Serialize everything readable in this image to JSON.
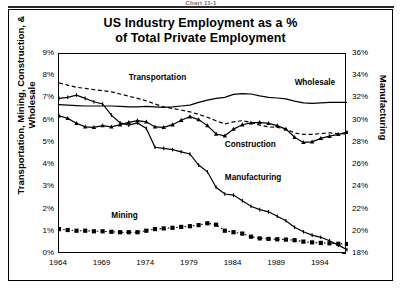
{
  "caption": "Chart 11-1",
  "chart_data": {
    "type": "line",
    "title": "US Industry Employment as a %\nof Total Private Employment",
    "title_line1": "US Industry Employment as a %",
    "title_line2": "of Total Private Employment",
    "xlabel": "",
    "ylabel": "Transportation, Mining, Construction, & Wholesale",
    "ylabel_right": "Manufacturing",
    "xlim": [
      1964,
      1997
    ],
    "ylim": [
      0,
      9
    ],
    "ylim_right": [
      18,
      36
    ],
    "grid": false,
    "legend": "in-plot annotations",
    "xticks": [
      "1964",
      "1969",
      "1974",
      "1979",
      "1984",
      "1989",
      "1994"
    ],
    "xtick_values": [
      1964,
      1969,
      1974,
      1979,
      1984,
      1989,
      1994
    ],
    "yticks": [
      "0%",
      "1%",
      "2%",
      "3%",
      "4%",
      "5%",
      "6%",
      "7%",
      "8%",
      "9%"
    ],
    "ytick_values": [
      0,
      1,
      2,
      3,
      4,
      5,
      6,
      7,
      8,
      9
    ],
    "yticks_right": [
      "18%",
      "20%",
      "22%",
      "24%",
      "26%",
      "28%",
      "30%",
      "32%",
      "34%",
      "36%"
    ],
    "ytick_values_right": [
      18,
      20,
      22,
      24,
      26,
      28,
      30,
      32,
      34,
      36
    ],
    "x": [
      1964,
      1965,
      1966,
      1967,
      1968,
      1969,
      1970,
      1971,
      1972,
      1973,
      1974,
      1975,
      1976,
      1977,
      1978,
      1979,
      1980,
      1981,
      1982,
      1983,
      1984,
      1985,
      1986,
      1987,
      1988,
      1989,
      1990,
      1991,
      1992,
      1993,
      1994,
      1995,
      1996,
      1997
    ],
    "series": [
      {
        "name": "Transportation",
        "axis": "left",
        "style": "dashed",
        "marker": "none",
        "values": [
          7.7,
          7.6,
          7.5,
          7.45,
          7.4,
          7.35,
          7.3,
          7.2,
          7.1,
          7.0,
          6.9,
          6.75,
          6.62,
          6.55,
          6.48,
          6.4,
          6.28,
          6.15,
          6.0,
          5.85,
          5.95,
          6.0,
          5.92,
          5.8,
          5.72,
          5.7,
          5.62,
          5.45,
          5.38,
          5.38,
          5.42,
          5.45,
          5.42,
          5.4
        ]
      },
      {
        "name": "Wholesale",
        "axis": "left",
        "style": "solid",
        "marker": "none",
        "values": [
          6.72,
          6.7,
          6.68,
          6.66,
          6.66,
          6.66,
          6.66,
          6.64,
          6.62,
          6.62,
          6.64,
          6.62,
          6.6,
          6.62,
          6.66,
          6.7,
          6.82,
          6.92,
          7.0,
          7.05,
          7.18,
          7.22,
          7.2,
          7.12,
          7.05,
          7.02,
          6.98,
          6.88,
          6.8,
          6.78,
          6.8,
          6.82,
          6.82,
          6.82
        ]
      },
      {
        "name": "Construction",
        "axis": "left",
        "style": "solid",
        "marker": "triangle",
        "values": [
          6.22,
          6.1,
          5.88,
          5.72,
          5.7,
          5.78,
          5.72,
          5.82,
          5.92,
          6.0,
          5.95,
          5.72,
          5.7,
          5.82,
          6.02,
          6.18,
          6.05,
          5.78,
          5.4,
          5.32,
          5.62,
          5.82,
          5.9,
          5.92,
          5.88,
          5.78,
          5.62,
          5.25,
          5.02,
          5.05,
          5.2,
          5.3,
          5.38,
          5.48
        ]
      },
      {
        "name": "Mining",
        "axis": "left",
        "style": "dotted",
        "marker": "square",
        "values": [
          1.12,
          1.08,
          1.05,
          1.05,
          1.02,
          1.02,
          1.0,
          0.98,
          0.98,
          0.98,
          1.05,
          1.12,
          1.15,
          1.18,
          1.22,
          1.25,
          1.3,
          1.38,
          1.32,
          1.05,
          0.98,
          0.92,
          0.78,
          0.7,
          0.68,
          0.66,
          0.65,
          0.62,
          0.56,
          0.52,
          0.5,
          0.48,
          0.46,
          0.45
        ]
      },
      {
        "name": "Manufacturing",
        "axis": "right",
        "style": "solid",
        "marker": "tick",
        "values": [
          32.0,
          32.1,
          32.3,
          32.0,
          31.7,
          31.5,
          30.5,
          29.8,
          29.6,
          29.8,
          29.3,
          27.6,
          27.5,
          27.4,
          27.2,
          27.0,
          26.0,
          25.4,
          24.0,
          23.4,
          23.3,
          22.8,
          22.3,
          22.0,
          21.8,
          21.4,
          21.0,
          20.4,
          20.0,
          19.7,
          19.5,
          19.2,
          18.8,
          18.4
        ]
      }
    ],
    "annotations": [
      {
        "text": "Transportation",
        "x": 1972,
        "y": 7.9
      },
      {
        "text": "Wholesale",
        "x": 1991,
        "y": 7.7
      },
      {
        "text": "Construction",
        "x": 1983,
        "y": 4.9
      },
      {
        "text": "Manufacturing",
        "x": 1983,
        "y": 3.4
      },
      {
        "text": "Mining",
        "x": 1970,
        "y": 1.7
      }
    ]
  }
}
